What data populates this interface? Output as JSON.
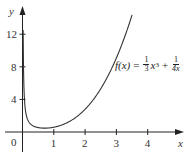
{
  "chart_data": {
    "type": "line",
    "title": "",
    "function_label": {
      "lhs": "f(x)",
      "eq": "=",
      "term1_num": "1",
      "term1_den": "3",
      "term1_var": "x",
      "term1_exp": "3",
      "plus": "+",
      "term2_num": "1",
      "term2_den": "4x"
    },
    "xlabel": "x",
    "ylabel": "y",
    "xlim": [
      -0.3,
      5.2
    ],
    "ylim": [
      -2.5,
      15.5
    ],
    "x_ticks": [
      "1",
      "2",
      "3",
      "4"
    ],
    "y_ticks": [
      "4",
      "8",
      "12"
    ],
    "origin_label": "0",
    "grid": false,
    "series": [
      {
        "name": "f(x) = x^3/3 + 1/(4x)",
        "x": [
          0.02,
          0.05,
          0.1,
          0.2,
          0.3,
          0.4,
          0.5,
          0.6,
          0.7,
          0.8,
          0.9,
          1.0,
          1.25,
          1.5,
          1.75,
          2.0,
          2.25,
          2.5,
          2.75,
          3.0,
          3.25,
          3.5
        ],
        "y": [
          12.5,
          5.0,
          2.5,
          1.25,
          0.84,
          0.65,
          0.54,
          0.49,
          0.47,
          0.48,
          0.52,
          0.58,
          0.85,
          1.29,
          1.93,
          2.79,
          3.91,
          5.31,
          7.02,
          9.08,
          11.52,
          14.36
        ]
      }
    ]
  },
  "colors": {
    "axis": "#222222",
    "curve": "#333333"
  }
}
